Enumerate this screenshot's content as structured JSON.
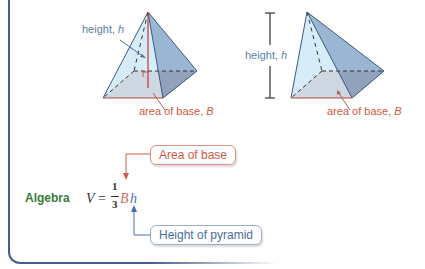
{
  "figure": {
    "left_pyramid": {
      "height_label": "height, ",
      "height_var": "h",
      "base_label": "area of base, ",
      "base_var": "B"
    },
    "right_pyramid": {
      "height_label": "height, ",
      "height_var": "h",
      "base_label": "area of base, ",
      "base_var": "B"
    }
  },
  "formula": {
    "section_label": "Algebra",
    "lhs": "V",
    "equals": "=",
    "numerator": "1",
    "denominator": "3",
    "base_var": "B",
    "height_var": "h"
  },
  "callouts": {
    "area": "Area of base",
    "height": "Height of pyramid"
  },
  "colors": {
    "blue_label": "#5a7fa8",
    "red_label": "#d05a45",
    "algebra_green": "#3b7a3b",
    "base_fill": "#c8736a",
    "face_fill": "#a9d4ee",
    "frame": "#4a5a8a"
  }
}
